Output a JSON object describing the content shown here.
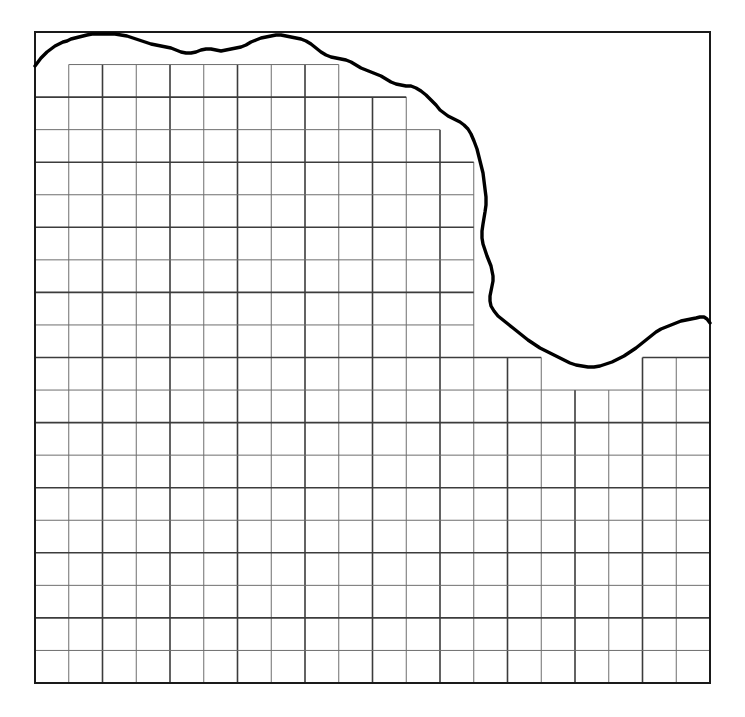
{
  "figure": {
    "title": "",
    "caption": ""
  },
  "colors": {
    "background": "#ffffff",
    "frame": "#1a1a1a",
    "grid_major": "#3c3c3c",
    "grid_minor": "#6e6e6e",
    "boundary_curve": "#000000"
  },
  "chart_data": {
    "type": "line",
    "title": "",
    "subtitle": "",
    "xlabel": "",
    "ylabel": "",
    "xlim": [
      0,
      20
    ],
    "ylim": [
      0,
      20
    ],
    "grid": true,
    "legend_position": "none",
    "tick_labels_x": [],
    "tick_labels_y": [],
    "annotations": [],
    "frame": {
      "x": 35,
      "y": 32,
      "width": 675,
      "height": 651
    },
    "grid_spec": {
      "columns": 20,
      "rows": 20,
      "cell_width": 33.75,
      "cell_height": 32.55,
      "origin_x": 35,
      "origin_y": 32,
      "clipped_to": "region below boundary curve",
      "major_every_columns": 2,
      "major_every_rows": 2
    },
    "series": [
      {
        "name": "boundary-curve",
        "stroke_width": 3.4,
        "points": [
          [
            35,
            66
          ],
          [
            38,
            62
          ],
          [
            41,
            58
          ],
          [
            44,
            55
          ],
          [
            47,
            52
          ],
          [
            51,
            49
          ],
          [
            55,
            46
          ],
          [
            59,
            44
          ],
          [
            63,
            42
          ],
          [
            67,
            41
          ],
          [
            71,
            39
          ],
          [
            75,
            38
          ],
          [
            79,
            37
          ],
          [
            83,
            36
          ],
          [
            87,
            35
          ],
          [
            92,
            34
          ],
          [
            97,
            34
          ],
          [
            103,
            34
          ],
          [
            109,
            34
          ],
          [
            115,
            34
          ],
          [
            121,
            35
          ],
          [
            127,
            36
          ],
          [
            133,
            38
          ],
          [
            139,
            40
          ],
          [
            145,
            42
          ],
          [
            151,
            44
          ],
          [
            156,
            45
          ],
          [
            161,
            46
          ],
          [
            166,
            47
          ],
          [
            171,
            48
          ],
          [
            176,
            50
          ],
          [
            181,
            52
          ],
          [
            186,
            53
          ],
          [
            191,
            53
          ],
          [
            196,
            52
          ],
          [
            201,
            50
          ],
          [
            206,
            49
          ],
          [
            211,
            49
          ],
          [
            216,
            50
          ],
          [
            221,
            51
          ],
          [
            226,
            50
          ],
          [
            231,
            49
          ],
          [
            236,
            48
          ],
          [
            241,
            47
          ],
          [
            246,
            45
          ],
          [
            251,
            42
          ],
          [
            256,
            40
          ],
          [
            261,
            38
          ],
          [
            266,
            37
          ],
          [
            271,
            36
          ],
          [
            276,
            35
          ],
          [
            281,
            35
          ],
          [
            286,
            36
          ],
          [
            291,
            37
          ],
          [
            296,
            38
          ],
          [
            301,
            39
          ],
          [
            306,
            41
          ],
          [
            311,
            44
          ],
          [
            316,
            48
          ],
          [
            321,
            52
          ],
          [
            326,
            55
          ],
          [
            331,
            57
          ],
          [
            336,
            58
          ],
          [
            341,
            59
          ],
          [
            346,
            60
          ],
          [
            351,
            62
          ],
          [
            356,
            65
          ],
          [
            361,
            68
          ],
          [
            366,
            70
          ],
          [
            371,
            72
          ],
          [
            376,
            74
          ],
          [
            381,
            76
          ],
          [
            386,
            79
          ],
          [
            391,
            82
          ],
          [
            396,
            84
          ],
          [
            401,
            85
          ],
          [
            406,
            86
          ],
          [
            411,
            86
          ],
          [
            416,
            88
          ],
          [
            421,
            91
          ],
          [
            426,
            95
          ],
          [
            431,
            100
          ],
          [
            436,
            105
          ],
          [
            440,
            110
          ],
          [
            444,
            113
          ],
          [
            448,
            116
          ],
          [
            452,
            118
          ],
          [
            456,
            120
          ],
          [
            460,
            122
          ],
          [
            464,
            125
          ],
          [
            468,
            129
          ],
          [
            471,
            134
          ],
          [
            474,
            141
          ],
          [
            477,
            149
          ],
          [
            479,
            157
          ],
          [
            481,
            165
          ],
          [
            483,
            173
          ],
          [
            484,
            181
          ],
          [
            485,
            189
          ],
          [
            486,
            197
          ],
          [
            486,
            205
          ],
          [
            485,
            212
          ],
          [
            484,
            218
          ],
          [
            483,
            224
          ],
          [
            482,
            231
          ],
          [
            482,
            238
          ],
          [
            483,
            244
          ],
          [
            485,
            250
          ],
          [
            487,
            256
          ],
          [
            489,
            261
          ],
          [
            491,
            266
          ],
          [
            492,
            271
          ],
          [
            493,
            276
          ],
          [
            493,
            281
          ],
          [
            492,
            286
          ],
          [
            491,
            291
          ],
          [
            490,
            296
          ],
          [
            490,
            301
          ],
          [
            491,
            306
          ],
          [
            494,
            311
          ],
          [
            498,
            316
          ],
          [
            503,
            320
          ],
          [
            508,
            324
          ],
          [
            513,
            328
          ],
          [
            518,
            332
          ],
          [
            523,
            336
          ],
          [
            528,
            340
          ],
          [
            534,
            344
          ],
          [
            540,
            348
          ],
          [
            546,
            351
          ],
          [
            552,
            354
          ],
          [
            558,
            357
          ],
          [
            564,
            360
          ],
          [
            570,
            363
          ],
          [
            576,
            365
          ],
          [
            582,
            366
          ],
          [
            588,
            367
          ],
          [
            594,
            367
          ],
          [
            600,
            366
          ],
          [
            606,
            364
          ],
          [
            612,
            362
          ],
          [
            618,
            359
          ],
          [
            624,
            356
          ],
          [
            630,
            352
          ],
          [
            636,
            348
          ],
          [
            641,
            344
          ],
          [
            646,
            340
          ],
          [
            651,
            336
          ],
          [
            656,
            332
          ],
          [
            661,
            329
          ],
          [
            666,
            327
          ],
          [
            671,
            325
          ],
          [
            676,
            323
          ],
          [
            681,
            321
          ],
          [
            686,
            320
          ],
          [
            691,
            319
          ],
          [
            696,
            318
          ],
          [
            700,
            317
          ],
          [
            704,
            317
          ],
          [
            707,
            319
          ],
          [
            710,
            323
          ]
        ]
      }
    ]
  }
}
